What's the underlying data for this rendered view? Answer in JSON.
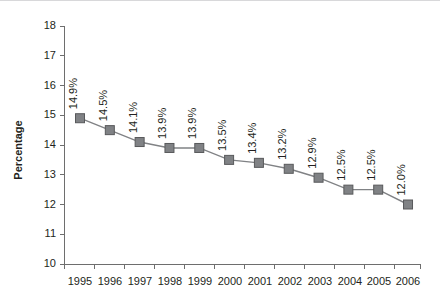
{
  "chart_data": {
    "type": "line",
    "title": "",
    "xlabel": "",
    "ylabel": "Percentage",
    "categories": [
      "1995",
      "1996",
      "1997",
      "1998",
      "1999",
      "2000",
      "2001",
      "2002",
      "2003",
      "2004",
      "2005",
      "2006"
    ],
    "values": [
      14.9,
      14.5,
      14.1,
      13.9,
      13.9,
      13.5,
      13.4,
      13.2,
      12.9,
      12.5,
      12.5,
      12.0
    ],
    "point_labels": [
      "14.9%",
      "14.5%",
      "14.1%",
      "13.9%",
      "13.9%",
      "13.5%",
      "13.4%",
      "13.2%",
      "12.9%",
      "12.5%",
      "12.5%",
      "12.0%"
    ],
    "ylim": [
      10,
      18
    ],
    "ytick_labels": [
      "10",
      "11",
      "12",
      "13",
      "14",
      "15",
      "16",
      "17",
      "18"
    ],
    "ytick_values": [
      10,
      11,
      12,
      13,
      14,
      15,
      16,
      17,
      18
    ],
    "grid": false,
    "legend": "none",
    "marker": "square",
    "point_label_rotation": -90,
    "colors": {
      "series": "#808285",
      "marker_fill": "#808285",
      "marker_stroke": "#58595b",
      "axis": "#6e6e6e",
      "text": "#231f20",
      "background": "#ffffff"
    }
  }
}
